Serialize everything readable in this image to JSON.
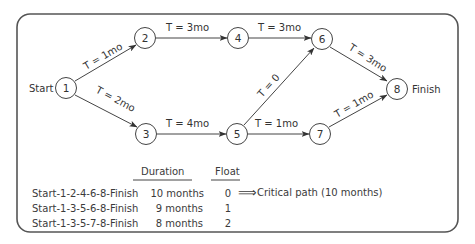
{
  "diagram": {
    "start_label": "Start",
    "finish_label": "Finish",
    "nodes": [
      {
        "id": "1",
        "label": "1"
      },
      {
        "id": "2",
        "label": "2"
      },
      {
        "id": "3",
        "label": "3"
      },
      {
        "id": "4",
        "label": "4"
      },
      {
        "id": "5",
        "label": "5"
      },
      {
        "id": "6",
        "label": "6"
      },
      {
        "id": "7",
        "label": "7"
      },
      {
        "id": "8",
        "label": "8"
      }
    ],
    "edges": [
      {
        "from": "1",
        "to": "2",
        "label": "T = 1mo"
      },
      {
        "from": "1",
        "to": "3",
        "label": "T = 2mo"
      },
      {
        "from": "2",
        "to": "4",
        "label": "T = 3mo"
      },
      {
        "from": "3",
        "to": "5",
        "label": "T = 4mo"
      },
      {
        "from": "4",
        "to": "6",
        "label": "T = 3mo"
      },
      {
        "from": "5",
        "to": "6",
        "label": "T = 0"
      },
      {
        "from": "5",
        "to": "7",
        "label": "T = 1mo"
      },
      {
        "from": "6",
        "to": "8",
        "label": "T = 3mo"
      },
      {
        "from": "7",
        "to": "8",
        "label": "T = 1mo"
      }
    ]
  },
  "table": {
    "headers": {
      "duration": "Duration",
      "float": "Float"
    },
    "rows": [
      {
        "path": "Start-1-2-4-6-8-Finish",
        "duration": "10 months",
        "float": "0",
        "note": "Critical path (10 months)"
      },
      {
        "path": "Start-1-3-5-6-8-Finish",
        "duration": "9 months",
        "float": "1",
        "note": ""
      },
      {
        "path": "Start-1-3-5-7-8-Finish",
        "duration": "8 months",
        "float": "2",
        "note": ""
      }
    ],
    "arrow_glyph": "⟹"
  }
}
